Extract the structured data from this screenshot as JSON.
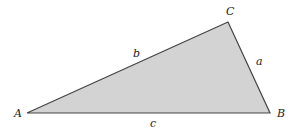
{
  "diagram": {
    "type": "triangle",
    "fill_color": "#d3d3d3",
    "stroke_color": "#444444",
    "vertices": [
      {
        "name": "A",
        "x": 27,
        "y": 113
      },
      {
        "name": "B",
        "x": 270,
        "y": 113
      },
      {
        "name": "C",
        "x": 228,
        "y": 22
      }
    ],
    "vertex_labels": {
      "A": "A",
      "B": "B",
      "C": "C"
    },
    "side_labels": {
      "a": "a",
      "b": "b",
      "c": "c"
    }
  }
}
